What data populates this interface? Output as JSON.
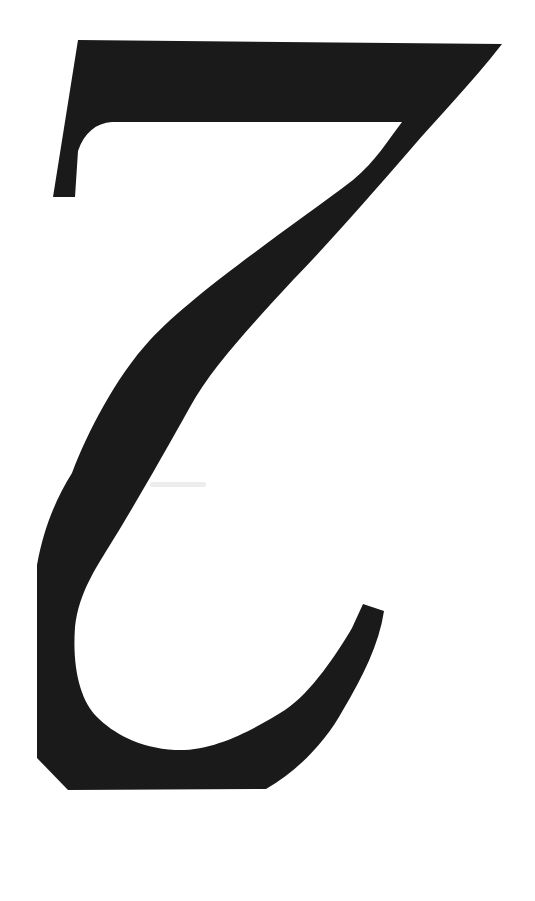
{
  "canvas": {
    "width": 535,
    "height": 901,
    "background": "#ffffff"
  },
  "glyph": {
    "character": "2",
    "rotation_deg": 180,
    "description": "Large black serif numeral 2 rotated 180 degrees (upside-down), printed/scanned on a white page",
    "color": "#1a1a1a"
  },
  "artifacts": {
    "smudge_color": "#ededed"
  }
}
